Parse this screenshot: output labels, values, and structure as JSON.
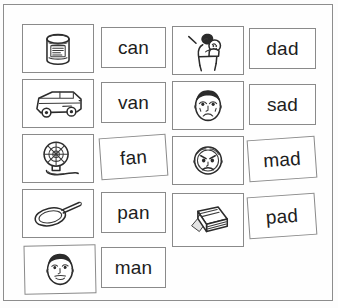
{
  "worksheet": {
    "title": "Word family picture and word matching worksheet",
    "frame_color": "#8d8d8d",
    "card_border_color": "#8a8a8a",
    "ink_color": "#2b2b2b",
    "background_color": "#fefefe"
  },
  "columns": [
    {
      "name": "an-family",
      "rows": [
        {
          "picture": "can-icon",
          "picture_label": "can",
          "word": "can",
          "rotation": 0
        },
        {
          "picture": "van-icon",
          "picture_label": "van",
          "word": "van",
          "rotation": 0
        },
        {
          "picture": "fan-icon",
          "picture_label": "fan",
          "word": "fan",
          "rotation": -4
        },
        {
          "picture": "frying-pan-icon",
          "picture_label": "pan",
          "word": "pan",
          "rotation": 0
        },
        {
          "picture": "man-face-icon",
          "picture_label": "man",
          "word": "man",
          "rotation": 0
        }
      ]
    },
    {
      "name": "ad-family",
      "rows": [
        {
          "picture": "dad-holding-baby-icon",
          "picture_label": "dad",
          "word": "dad",
          "rotation": 0
        },
        {
          "picture": "sad-face-icon",
          "picture_label": "sad",
          "word": "sad",
          "rotation": 0
        },
        {
          "picture": "mad-face-icon",
          "picture_label": "mad",
          "word": "mad",
          "rotation": -4
        },
        {
          "picture": "writing-pad-icon",
          "picture_label": "pad",
          "word": "pad",
          "rotation": -4
        }
      ]
    }
  ]
}
